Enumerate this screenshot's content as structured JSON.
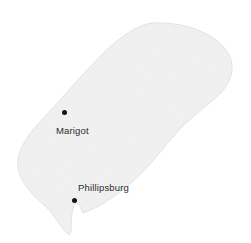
{
  "map": {
    "title": "Saint Martin",
    "background_color": "#ffffff",
    "landmass": {
      "name": "Saint Martin island",
      "fill_color": "#f1f1f1",
      "stroke_color": "#e2e2e2"
    },
    "cities": [
      {
        "name": "Marigot",
        "label": "Marigot",
        "marker_color": "#141414",
        "marker_x": 64,
        "marker_y": 112,
        "label_x": 56,
        "label_y": 125
      },
      {
        "name": "Phillipsburg",
        "label": "Phillipsburg",
        "marker_color": "#141414",
        "marker_x": 74,
        "marker_y": 200,
        "label_x": 78,
        "label_y": 182
      }
    ]
  }
}
